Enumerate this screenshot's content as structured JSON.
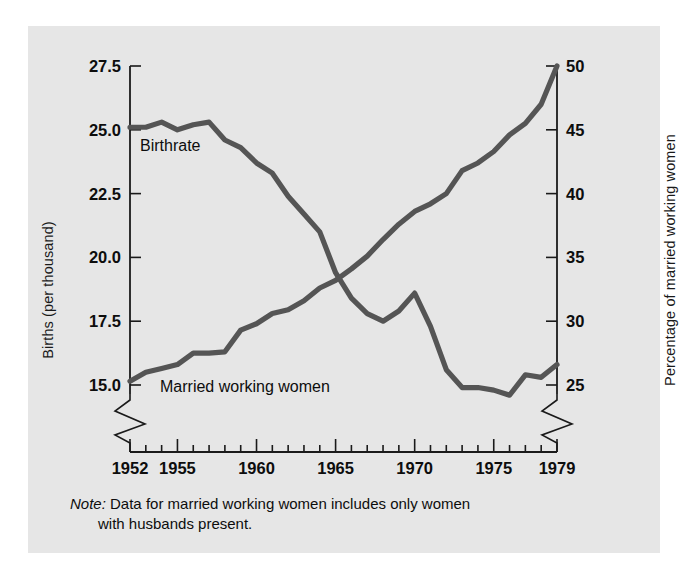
{
  "figure": {
    "panel_color": "#e6e6e6",
    "page_color": "#ffffff",
    "line_color": "#555555",
    "axis_color": "#1a1a1a"
  },
  "labels": {
    "ylabel_left": "Births (per thousand)",
    "ylabel_right": "Percentage of married working women",
    "series_birthrate": "Birthrate",
    "series_mww": "Married working women"
  },
  "note": {
    "word": "Note:",
    "line1": " Data for married working women includes only women",
    "line2": "with husbands present."
  },
  "chart_data": {
    "type": "line",
    "title": "",
    "xlabel": "",
    "ylabel": "Births (per thousand)",
    "ylabel_secondary": "Percentage of married working women",
    "grid": false,
    "legend": "inline-annotations",
    "xlim": [
      1952,
      1979
    ],
    "ylim": [
      15.0,
      27.5
    ],
    "ylim_secondary": [
      25,
      50
    ],
    "axis_break": true,
    "x_tick_labels": [
      "1952",
      "1955",
      "1960",
      "1965",
      "1970",
      "1975",
      "1979"
    ],
    "x_tick_values": [
      1952,
      1955,
      1960,
      1965,
      1970,
      1975,
      1979
    ],
    "x_minor_ticks_every": 1,
    "y_tick_labels_left": [
      "27.5",
      "25.0",
      "22.5",
      "20.0",
      "17.5",
      "15.0"
    ],
    "y_tick_values_left": [
      27.5,
      25.0,
      22.5,
      20.0,
      17.5,
      15.0
    ],
    "y_tick_labels_right": [
      "50",
      "45",
      "40",
      "35",
      "30",
      "25"
    ],
    "y_tick_values_right": [
      50,
      45,
      40,
      35,
      30,
      25
    ],
    "x": [
      1952,
      1953,
      1954,
      1955,
      1956,
      1957,
      1958,
      1959,
      1960,
      1961,
      1962,
      1963,
      1964,
      1965,
      1966,
      1967,
      1968,
      1969,
      1970,
      1971,
      1972,
      1973,
      1974,
      1975,
      1976,
      1977,
      1978,
      1979
    ],
    "series": [
      {
        "name": "Birthrate",
        "axis": "left",
        "units": "births per thousand",
        "values": [
          25.1,
          25.1,
          25.3,
          25.0,
          25.2,
          25.3,
          24.6,
          24.3,
          23.7,
          23.3,
          22.4,
          21.7,
          21.0,
          19.4,
          18.4,
          17.8,
          17.5,
          17.9,
          18.6,
          17.3,
          15.6,
          14.9,
          14.9,
          14.8,
          14.6,
          15.4,
          15.3,
          15.8
        ]
      },
      {
        "name": "Married working women",
        "axis": "right",
        "units": "percent",
        "values": [
          25.3,
          26.0,
          26.3,
          26.6,
          27.5,
          27.5,
          27.6,
          29.3,
          29.8,
          30.6,
          30.9,
          31.6,
          32.6,
          33.2,
          34.1,
          35.1,
          36.4,
          37.6,
          38.6,
          39.2,
          40.0,
          41.8,
          42.4,
          43.3,
          44.6,
          45.5,
          47.0,
          50.0
        ]
      }
    ],
    "annotations": [
      {
        "text": "Birthrate",
        "series": "Birthrate"
      },
      {
        "text": "Married working women",
        "series": "Married working women"
      }
    ]
  }
}
